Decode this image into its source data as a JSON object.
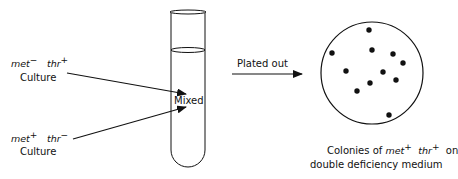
{
  "diagram": {
    "culture1": {
      "gene1": "met",
      "sign1": "−",
      "gene2": "thr",
      "sign2": "+",
      "label": "Culture"
    },
    "culture2": {
      "gene1": "met",
      "sign1": "+",
      "gene2": "thr",
      "sign2": "−",
      "label": "Culture"
    },
    "tube_label": "Mixed",
    "arrow_label": "Plated out",
    "result": {
      "line1_prefix": "Colonies of",
      "gene1": "met",
      "sign1": "+",
      "gene2": "thr",
      "sign2": "+",
      "line1_suffix": "on",
      "line2": "double deficiency medium"
    },
    "colony_count": 11
  }
}
